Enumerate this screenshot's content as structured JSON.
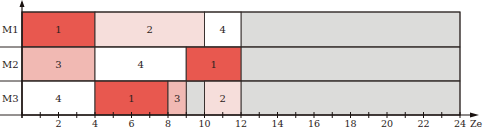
{
  "chart_data": {
    "type": "gantt",
    "title": "",
    "xlabel": "Ze",
    "ylabel": "",
    "xlim": [
      0,
      24
    ],
    "x_ticks_labeled": [
      2,
      4,
      6,
      8,
      10,
      12,
      14,
      16,
      18,
      20,
      22,
      24
    ],
    "x_minor_step": 1,
    "machines": [
      "M1",
      "M2",
      "M3"
    ],
    "tasks": [
      {
        "machine": "M1",
        "job": "1",
        "start": 0,
        "end": 4,
        "color": "#e8584f"
      },
      {
        "machine": "M1",
        "job": "2",
        "start": 4,
        "end": 10,
        "color": "#f6dedb"
      },
      {
        "machine": "M1",
        "job": "4",
        "start": 10,
        "end": 12,
        "color": "#ffffff"
      },
      {
        "machine": "M2",
        "job": "3",
        "start": 0,
        "end": 4,
        "color": "#f1b9b3"
      },
      {
        "machine": "M2",
        "job": "4",
        "start": 4,
        "end": 9,
        "color": "#ffffff"
      },
      {
        "machine": "M2",
        "job": "1",
        "start": 9,
        "end": 12,
        "color": "#e8584f"
      },
      {
        "machine": "M3",
        "job": "4",
        "start": 0,
        "end": 4,
        "color": "#ffffff"
      },
      {
        "machine": "M3",
        "job": "1",
        "start": 4,
        "end": 8,
        "color": "#e8584f"
      },
      {
        "machine": "M3",
        "job": "3",
        "start": 8,
        "end": 9,
        "color": "#f1b9b3"
      },
      {
        "machine": "M3",
        "job": "2",
        "start": 10,
        "end": 12,
        "color": "#f6dedb"
      }
    ],
    "idle_regions": [
      {
        "machine": "M1",
        "start": 12,
        "end": 24
      },
      {
        "machine": "M2",
        "start": 12,
        "end": 24
      },
      {
        "machine": "M3",
        "start": 9,
        "end": 10
      },
      {
        "machine": "M3",
        "start": 12,
        "end": 24
      }
    ],
    "idle_color": "#dcdcda",
    "grid": false
  }
}
